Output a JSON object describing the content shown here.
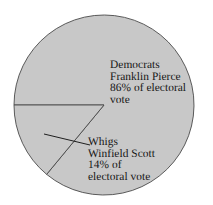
{
  "figure": {
    "background_color": "#ffffff",
    "text_color": "#161616"
  },
  "chart_data": {
    "type": "pie",
    "title": "",
    "subtitle": "",
    "xlabel": "",
    "ylabel": "",
    "grid": false,
    "legend_position": "none",
    "units": "percent of electoral vote",
    "total": 100,
    "slice_fill_color": "#c8c8c8",
    "slice_edge_color": "#4a4a4a",
    "center": {
      "x": 104,
      "y": 105
    },
    "radius": 90,
    "start_angle_deg": 180,
    "categories": [
      "Democrats",
      "Whigs"
    ],
    "values": [
      86,
      14
    ],
    "slices": [
      {
        "party": "Democrats",
        "candidate": "Franklin Pierce",
        "value": 86,
        "value_label": "86% of electoral vote",
        "color": "#c8c8c8",
        "angle_deg": 309.6,
        "label_lines": [
          "Democrats",
          "Franklin Pierce",
          "86% of electoral",
          "vote"
        ]
      },
      {
        "party": "Whigs",
        "candidate": "Winfield Scott",
        "value": 14,
        "value_label": "14% of electoral vote",
        "color": "#c8c8c8",
        "angle_deg": 50.4,
        "label_lines": [
          "Whigs",
          "Winfield Scott",
          "14% of",
          "electoral vote"
        ]
      }
    ],
    "annotations": [
      {
        "name": "whigs-leader-line",
        "from": {
          "x": 44,
          "y": 134
        },
        "to": {
          "x": 90,
          "y": 145
        }
      }
    ]
  },
  "labels": {
    "democrats": {
      "line1": "Democrats",
      "line2": "Franklin Pierce",
      "line3": "86% of electoral",
      "line4": "vote"
    },
    "whigs": {
      "line1": "Whigs",
      "line2": "Winfield Scott",
      "line3": "14% of",
      "line4": "electoral vote"
    }
  }
}
